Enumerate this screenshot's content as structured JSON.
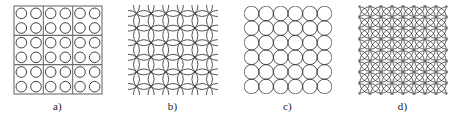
{
  "figure": {
    "title": "",
    "background_color": "#ffffff",
    "line_color": "#2b2b2b",
    "frame_color": "#6e6e6e",
    "width": 462,
    "height": 126
  },
  "panels": [
    {
      "id": "a",
      "label": "a)",
      "description": "square frame divided into 3 by 3 blocks, each block containing 2 by 2 separated circles",
      "pattern_type": "grid-of-separated-circles-with-block-frame",
      "grid_columns": 6,
      "grid_rows": 6,
      "block_columns": 3,
      "block_rows": 3,
      "frame_size": 88,
      "cell_size": 14.6,
      "circle_radius": 5.3,
      "circle_stroke_width": 0.9,
      "frame_stroke_width": 1.1,
      "circles_total": 36
    },
    {
      "id": "b",
      "label": "b)",
      "description": "square lattice of strongly overlapping circles",
      "pattern_type": "overlapping-circle-covering",
      "grid_columns": 7,
      "grid_rows": 7,
      "spacing": 14.6,
      "circle_radius": 10.3,
      "circle_stroke_width": 0.8,
      "circles_total": 49
    },
    {
      "id": "c",
      "label": "c)",
      "description": "square lattice of mutually tangent circles",
      "pattern_type": "tangent-circle-packing",
      "grid_columns": 6,
      "grid_rows": 6,
      "spacing": 14.6,
      "circle_radius": 7.3,
      "circle_stroke_width": 0.8,
      "circles_total": 36
    },
    {
      "id": "d",
      "label": "d)",
      "description": "dense square lattice of heavily overlapping circles",
      "pattern_type": "dense-overlapping-circle-covering",
      "grid_columns": 9,
      "grid_rows": 9,
      "spacing": 11.0,
      "circle_radius": 10.3,
      "circle_stroke_width": 0.7,
      "circles_total": 81
    }
  ]
}
